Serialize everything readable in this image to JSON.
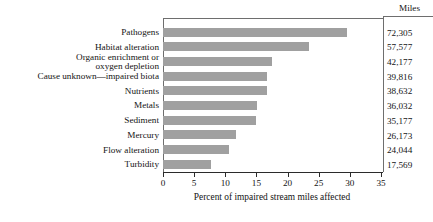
{
  "chart_data": {
    "type": "bar",
    "orientation": "horizontal",
    "title": "",
    "xlabel": "Percent of impaired stream miles affected",
    "ylabel": "",
    "xlim": [
      0,
      35
    ],
    "xticks": [
      0,
      5,
      10,
      15,
      20,
      25,
      30,
      35
    ],
    "xtick_labels": [
      "0",
      "5",
      "10",
      "15",
      "20",
      "25",
      "30",
      "35"
    ],
    "grid": false,
    "legend": null,
    "bar_color": "#a0a0a0",
    "categories": [
      "Pathogens",
      "Habitat alteration",
      "Organic enrichment or\noxygen depletion",
      "Cause unknown—impaired biota",
      "Nutrients",
      "Metals",
      "Sediment",
      "Mercury",
      "Flow alteration",
      "Turbidity"
    ],
    "values": [
      29.5,
      23.4,
      17.5,
      16.7,
      16.7,
      15.1,
      14.9,
      11.7,
      10.6,
      7.7
    ],
    "annotation_column": {
      "header": "Miles",
      "values": [
        "72,305",
        "57,577",
        "42,177",
        "39,816",
        "38,632",
        "36,032",
        "35,177",
        "26,173",
        "24,044",
        "17,569"
      ]
    }
  }
}
